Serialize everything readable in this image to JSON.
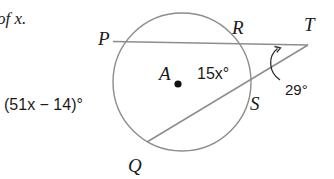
{
  "problem": {
    "prompt_fragment": "of x."
  },
  "figure": {
    "type": "circle-secant-tangent-angle-diagram",
    "background_color": "#ffffff",
    "stroke_color": "#8d8d8d",
    "text_color": "#1a1a1a",
    "circle": {
      "center_label": "A",
      "center_x": 182,
      "center_y": 82,
      "radius": 69
    },
    "points": [
      {
        "name": "P",
        "label": "P",
        "x": 116,
        "y": 42,
        "label_x": 98,
        "label_y": 45
      },
      {
        "name": "R",
        "label": "R",
        "x": 243,
        "y": 44,
        "label_x": 232,
        "label_y": 34
      },
      {
        "name": "T",
        "label": "T",
        "x": 308,
        "y": 45,
        "label_x": 304,
        "label_y": 31
      },
      {
        "name": "S",
        "label": "S",
        "x": 246,
        "y": 91,
        "label_x": 250,
        "label_y": 110
      },
      {
        "name": "Q",
        "label": "Q",
        "x": 150,
        "y": 141,
        "label_x": 128,
        "label_y": 172
      }
    ],
    "labels": {
      "arc_expression_left": "(51x − 14)°",
      "arc_expression_left_x": 4,
      "arc_expression_left_y": 110,
      "inner_angle": "15x°",
      "inner_angle_x": 197,
      "inner_angle_y": 79,
      "vertex_angle": "29°",
      "vertex_angle_x": 285,
      "vertex_angle_y": 95
    }
  },
  "measures": {
    "exterior_angle_at_T": "29°",
    "arc_RS": "15x°",
    "arc_PQ": "(51x − 14)°"
  }
}
